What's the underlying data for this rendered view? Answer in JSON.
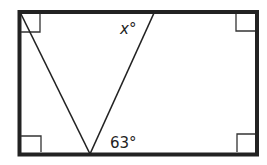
{
  "diagram": {
    "rectangle": {
      "x": 19,
      "y": 12,
      "width": 238,
      "height": 142
    },
    "right_angle_markers": [
      "top-left",
      "top-right",
      "bottom-left",
      "bottom-right"
    ],
    "segments": [
      {
        "from": [
          21,
          14
        ],
        "to": [
          90,
          154
        ]
      },
      {
        "from": [
          154,
          12
        ],
        "to": [
          90,
          154
        ]
      }
    ],
    "labels": {
      "top_angle_var": "x",
      "top_angle_unit": "°",
      "bottom_angle": "63°"
    },
    "colors": {
      "stroke": "#222222",
      "background": "#ffffff"
    }
  }
}
